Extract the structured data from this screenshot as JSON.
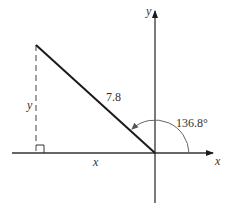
{
  "diagram": {
    "axes": {
      "x_label": "x",
      "y_label": "y"
    },
    "triangle": {
      "hypotenuse_label": "7.8",
      "horizontal_leg_label": "x",
      "vertical_leg_label": "y",
      "right_angle_marker": true
    },
    "angle": {
      "label": "136.8°",
      "degrees": 136.8
    },
    "colors": {
      "line": "#1a1a1a",
      "axis": "#333333",
      "arc": "#666666",
      "text": "#333333"
    }
  }
}
